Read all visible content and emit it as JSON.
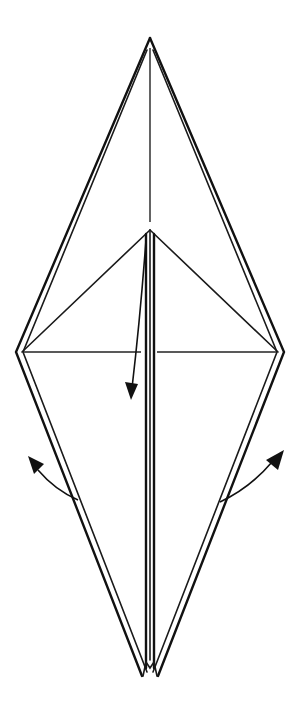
{
  "diagram": {
    "type": "origami-folding-step",
    "description": "Bird-base style diamond (kite) with center flaps; arrows indicate folding the top triangle down and swinging the lower side flaps outward",
    "colors": {
      "line": "#111111",
      "background": "#ffffff"
    },
    "elements": {
      "outer_diamond": {
        "top": [
          150,
          38
        ],
        "left": [
          16,
          352
        ],
        "right": [
          284,
          352
        ],
        "bottom_left": [
          143,
          676
        ],
        "bottom_right": [
          157,
          676
        ]
      },
      "inner_triangle": {
        "apex": [
          150,
          230
        ],
        "left": [
          22,
          352
        ],
        "right": [
          278,
          352
        ]
      },
      "horizontal_crease": {
        "y": 352,
        "from_x": 22,
        "to_x": 278,
        "gap": [
          137,
          156
        ]
      },
      "vertical_crease_top": {
        "x": 150,
        "from_y": 45,
        "to_y": 222
      },
      "arrows": [
        {
          "id": "fold-down-arrow",
          "direction": "down",
          "from": [
            146,
            250
          ],
          "to": [
            131,
            398
          ]
        },
        {
          "id": "left-swing-arrow",
          "direction": "up-left",
          "from": [
            78,
            500
          ],
          "to": [
            28,
            458
          ]
        },
        {
          "id": "right-swing-arrow",
          "direction": "up-right",
          "from": [
            220,
            500
          ],
          "to": [
            283,
            452
          ]
        }
      ]
    }
  }
}
